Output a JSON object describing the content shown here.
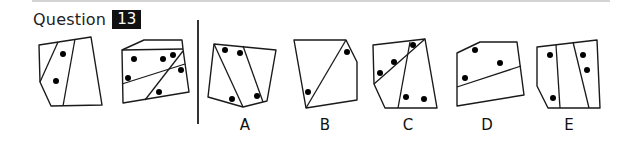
{
  "header": {
    "question_label": "Question",
    "question_number": "13"
  },
  "question_figures": [
    {
      "id": "figure-1",
      "outline": "39,45 91,37 102,105 51,106 40,82",
      "lines": [
        [
          58,
          42,
          40,
          82
        ],
        [
          75,
          39,
          63,
          106
        ]
      ],
      "dots": [
        [
          63,
          54
        ],
        [
          56,
          81
        ]
      ]
    },
    {
      "id": "figure-2",
      "outline": "122,50 144,40 182,40 183,49 189,92 123,103",
      "lines": [
        [
          122,
          50,
          183,
          49
        ],
        [
          122,
          84,
          185,
          64
        ],
        [
          145,
          100,
          183,
          51
        ]
      ],
      "dots": [
        [
          134,
          59
        ],
        [
          163,
          59
        ],
        [
          173,
          55
        ],
        [
          181,
          70
        ],
        [
          128,
          78
        ],
        [
          159,
          92
        ]
      ]
    }
  ],
  "options": [
    {
      "label": "A",
      "label_x": 245,
      "outline": "214,44 276,50 267,101 243,107 208,97",
      "lines": [
        [
          214,
          44,
          243,
          107
        ],
        [
          243,
          46,
          263,
          102
        ]
      ],
      "dots": [
        [
          225,
          50
        ],
        [
          240,
          53
        ],
        [
          232,
          99
        ],
        [
          257,
          96
        ]
      ]
    },
    {
      "label": "B",
      "label_x": 325,
      "outline": "294,40 346,40 357,62 357,100 306,108",
      "lines": [
        [
          346,
          40,
          306,
          108
        ]
      ],
      "dots": [
        [
          347,
          52
        ],
        [
          308,
          92
        ]
      ]
    },
    {
      "label": "C",
      "label_x": 408,
      "outline": "373,45 425,39 437,108 385,108 374,84",
      "lines": [
        [
          374,
          84,
          425,
          39
        ],
        [
          410,
          42,
          398,
          108
        ]
      ],
      "dots": [
        [
          413,
          45
        ],
        [
          394,
          62
        ],
        [
          380,
          73
        ],
        [
          406,
          97
        ],
        [
          424,
          99
        ]
      ]
    },
    {
      "label": "D",
      "label_x": 487,
      "outline": "457,53 480,42 517,42 524,95 457,106",
      "lines": [
        [
          457,
          87,
          521,
          66
        ]
      ],
      "dots": [
        [
          475,
          50
        ],
        [
          500,
          63
        ],
        [
          465,
          78
        ]
      ]
    },
    {
      "label": "E",
      "label_x": 569,
      "outline": "537,47 597,40 600,108 548,108 537,86",
      "lines": [
        [
          556,
          45,
          560,
          108
        ],
        [
          573,
          42,
          589,
          108
        ]
      ],
      "dots": [
        [
          550,
          55
        ],
        [
          583,
          55
        ],
        [
          587,
          70
        ],
        [
          553,
          98
        ]
      ]
    }
  ],
  "colors": {
    "stroke": "#1a1a1a",
    "dot": "#000000",
    "badge_bg": "#111111",
    "badge_fg": "#ffffff",
    "rule": "#d4d4d4"
  }
}
